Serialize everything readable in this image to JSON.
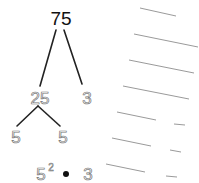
{
  "tree": {
    "root": "75",
    "level1": [
      "25",
      "3"
    ],
    "level2": [
      "5",
      "5"
    ]
  },
  "result": {
    "base": "5",
    "exponent": "2",
    "operator": "•",
    "factor": "3"
  },
  "colors": {
    "root_text": "#111111",
    "branch": "#222222",
    "outline_text": "#777777",
    "ruled_lines": "#9a9a9a"
  }
}
